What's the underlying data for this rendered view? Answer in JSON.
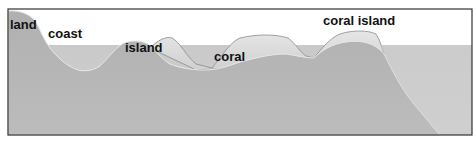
{
  "diagram": {
    "type": "cross-section",
    "labels": [
      {
        "id": "land",
        "text": "land",
        "x": 10,
        "y": 18
      },
      {
        "id": "coast",
        "text": "coast",
        "x": 48,
        "y": 27
      },
      {
        "id": "island",
        "text": "island",
        "x": 125,
        "y": 41
      },
      {
        "id": "coral",
        "text": "coral",
        "x": 214,
        "y": 50
      },
      {
        "id": "coral_island",
        "text": "coral island",
        "x": 323,
        "y": 14
      }
    ],
    "colors": {
      "sky": "#ffffff",
      "water": "#c4c4c4",
      "seabed": "#b2b2b2",
      "coral": "#dcdcdc",
      "outline": "#555555",
      "frame": "#333333",
      "label": "#111111"
    },
    "water_level_y": 45
  }
}
